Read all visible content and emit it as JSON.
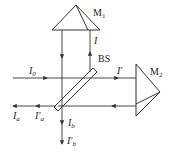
{
  "diagram": {
    "type": "interferometer",
    "components": {
      "mirror1": {
        "label": "M",
        "subscript": "1"
      },
      "mirror2": {
        "label": "M",
        "subscript": "2"
      },
      "beam_splitter": {
        "label": "BS"
      }
    },
    "beams": {
      "input": {
        "label": "I",
        "subscript": "0"
      },
      "reflected_to_m1": {
        "label": "I",
        "subscript": ""
      },
      "transmitted_to_m2": {
        "label": "I'",
        "subscript": ""
      },
      "output_a": {
        "label": "I",
        "subscript": "a"
      },
      "output_a_prime": {
        "label": "I'",
        "subscript": "a"
      },
      "output_b": {
        "label": "I",
        "subscript": "b"
      },
      "output_b_prime": {
        "label": "I'",
        "subscript": "b"
      }
    },
    "colors": {
      "line": "#333333",
      "background": "#ffffff"
    }
  }
}
